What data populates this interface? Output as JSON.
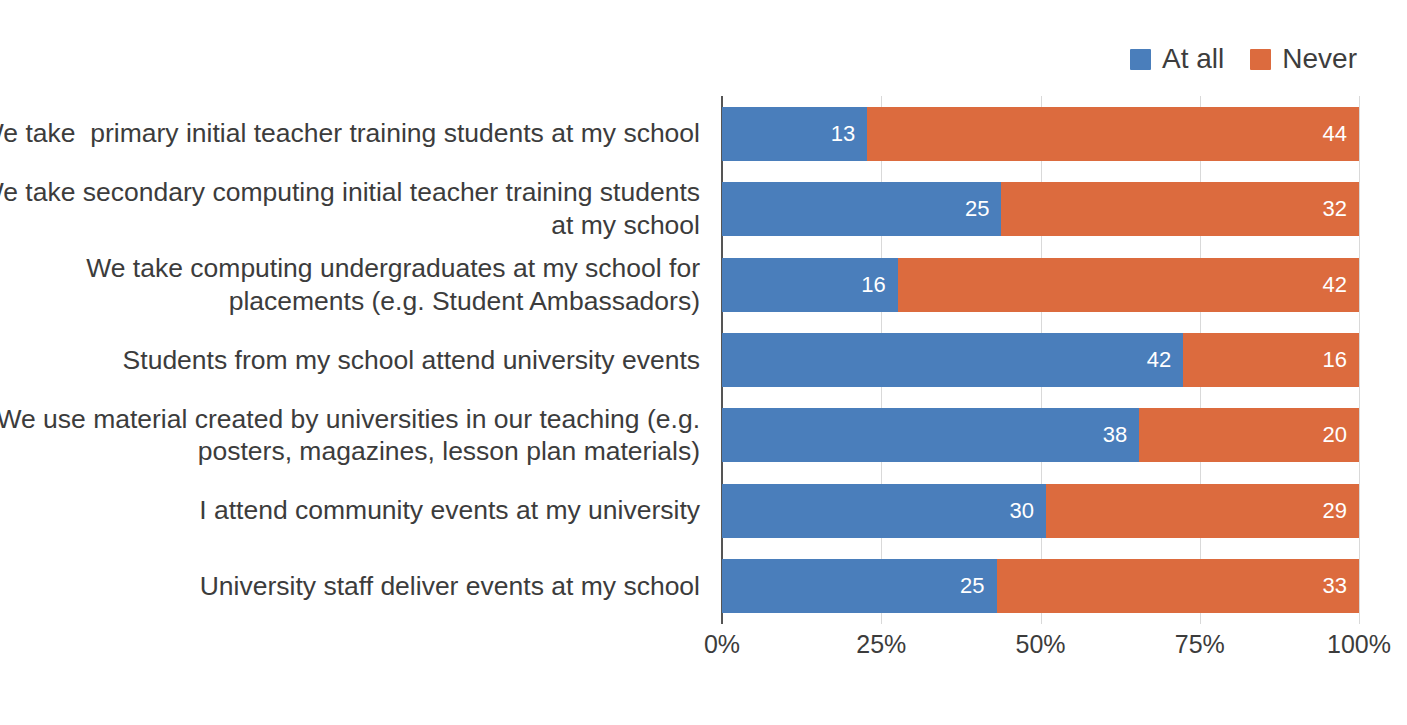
{
  "chart_data": {
    "type": "bar",
    "orientation": "horizontal",
    "stacked": true,
    "normalized": true,
    "title": "",
    "xlabel": "",
    "ylabel": "",
    "xlim": [
      0,
      100
    ],
    "grid": true,
    "legend_position": "top-right",
    "xticks": [
      "0%",
      "25%",
      "50%",
      "75%",
      "100%"
    ],
    "xtick_values": [
      0,
      25,
      50,
      75,
      100
    ],
    "categories": [
      "We take  primary initial teacher training students at my school",
      "We take secondary computing initial teacher training students at my school",
      "We take computing undergraduates at my school for placements (e.g. Student Ambassadors)",
      "Students from my school attend university events",
      "We use material created by universities in our teaching (e.g. posters, magazines, lesson plan materials)",
      "I attend community events at my university",
      "University staff deliver events at my school"
    ],
    "category_lines": [
      [
        "We take  primary initial teacher training students at my school"
      ],
      [
        "We take secondary computing initial teacher training students",
        "at my school"
      ],
      [
        "We take computing undergraduates at my school for",
        "placements (e.g. Student Ambassadors)"
      ],
      [
        "Students from my school attend university events"
      ],
      [
        "We use material created by universities in our teaching (e.g.",
        "posters, magazines, lesson plan materials)"
      ],
      [
        "I attend community events at my university"
      ],
      [
        "University staff deliver events at my school"
      ]
    ],
    "series": [
      {
        "name": "At all",
        "color": "#4a7ebb",
        "values": [
          13,
          25,
          16,
          42,
          38,
          30,
          25
        ]
      },
      {
        "name": "Never",
        "color": "#dc6b3e",
        "values": [
          44,
          32,
          42,
          16,
          20,
          29,
          33
        ]
      }
    ]
  },
  "legend": {
    "entries": [
      {
        "label": "At all",
        "color": "#4a7ebb"
      },
      {
        "label": "Never",
        "color": "#dc6b3e"
      }
    ]
  },
  "caption": {
    "text": ""
  },
  "colors": {
    "at_all": "#4a7ebb",
    "never": "#dc6b3e",
    "gridline": "#d9d9d9",
    "axis": "#555555",
    "text": "#3c3c3c",
    "value_label": "#ffffff",
    "background": "#ffffff"
  }
}
